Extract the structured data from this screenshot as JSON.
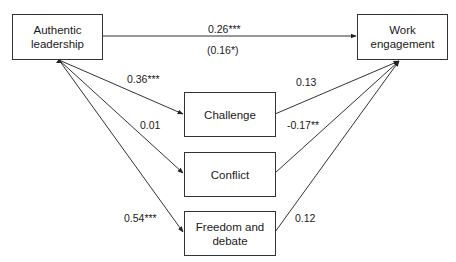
{
  "diagram": {
    "type": "mediation-path-model",
    "nodes": {
      "predictor": {
        "id": "authentic_leadership",
        "label": "Authentic\nleadership",
        "line1": "Authentic",
        "line2": "leadership"
      },
      "outcome": {
        "id": "work_engagement",
        "label": "Work\nengagement",
        "line1": "Work",
        "line2": "engagement"
      },
      "mediators": [
        {
          "id": "challenge",
          "line1": "Challenge",
          "line2": ""
        },
        {
          "id": "conflict",
          "line1": "Conflict",
          "line2": ""
        },
        {
          "id": "freedom_and_debate",
          "line1": "Freedom and",
          "line2": "debate"
        }
      ]
    },
    "edges": {
      "direct": {
        "from": "authentic_leadership",
        "to": "work_engagement",
        "label": "0.26***",
        "label_secondary": "(0.16*)"
      },
      "a_paths": [
        {
          "from": "authentic_leadership",
          "to": "challenge",
          "label": "0.36***"
        },
        {
          "from": "authentic_leadership",
          "to": "conflict",
          "label": "0.01"
        },
        {
          "from": "authentic_leadership",
          "to": "freedom_and_debate",
          "label": "0.54***"
        }
      ],
      "b_paths": [
        {
          "from": "challenge",
          "to": "work_engagement",
          "label": "0.13"
        },
        {
          "from": "conflict",
          "to": "work_engagement",
          "label": "-0.17**"
        },
        {
          "from": "freedom_and_debate",
          "to": "work_engagement",
          "label": "0.12"
        }
      ]
    },
    "colors": {
      "line": "#333333",
      "text": "#1a1a1a",
      "background": "#ffffff"
    }
  }
}
